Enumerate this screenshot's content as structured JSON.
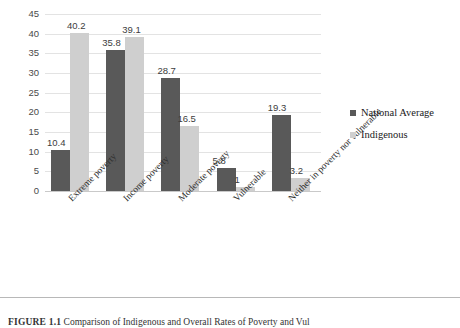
{
  "chart_data": {
    "type": "bar",
    "title": "",
    "xlabel": "",
    "ylabel": "",
    "ylim": [
      0,
      45
    ],
    "yticks": [
      0,
      5,
      10,
      15,
      20,
      25,
      30,
      35,
      40,
      45
    ],
    "grid": true,
    "legend_position": "right",
    "categories": [
      "Extreme poverty",
      "Income poverty",
      "Moderate poverty",
      "Vulnerable",
      "Neither in poverty nor vulnerable"
    ],
    "series": [
      {
        "name": "National Average",
        "color": "#595959",
        "values": [
          10.4,
          35.8,
          28.7,
          5.8,
          19.3
        ],
        "labels": [
          "10.4",
          "35.8",
          "28.7",
          "5.8",
          "19.3"
        ]
      },
      {
        "name": "Indigenous",
        "color": "#cfcfcf",
        "values": [
          40.2,
          39.1,
          16.5,
          1,
          3.2
        ],
        "labels": [
          "40.2",
          "39.1",
          "16.5",
          "1",
          "3.2"
        ]
      }
    ]
  },
  "legend": {
    "items": [
      {
        "label": "National Average",
        "color": "#595959"
      },
      {
        "label": "Indigenous",
        "color": "#cfcfcf"
      }
    ]
  },
  "caption": {
    "label": "FIGURE 1.1",
    "text": "Comparison of Indigenous and Overall Rates of Poverty and Vul"
  }
}
